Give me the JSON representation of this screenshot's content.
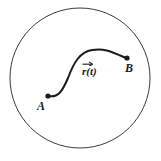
{
  "figure": {
    "background_color": "#ffffff",
    "stroke_color": "#3a3a3a",
    "curve_color": "#1b1b1b",
    "label_color": "#1b1b1b",
    "boundary": {
      "shape": "circle",
      "center_x": 80,
      "center_y": 78,
      "radius": 70,
      "stroke_width": 1
    },
    "curve": {
      "shape": "s-curve",
      "path": "M 48 96 C 58 98 62 92 68 78 C 74 62 80 52 92 50 C 104 48 110 51 126 58",
      "start_point": {
        "x": 48,
        "y": 96
      },
      "end_point": {
        "x": 127,
        "y": 58
      },
      "stroke_width": 2,
      "dot_radius": 2.6
    },
    "labels": {
      "start": "A",
      "end": "B",
      "vector_function": "r(t)",
      "vector_symbol": "r",
      "vector_argument": "(t)"
    }
  }
}
